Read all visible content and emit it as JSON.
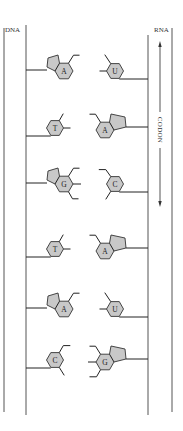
{
  "labels": {
    "dna": "DNA",
    "rna": "RNA",
    "codon": "CODON"
  },
  "colors": {
    "base_fill": "#c8c8c8",
    "line": "#333333",
    "background": "#ffffff"
  },
  "pairs": [
    {
      "dna_base": "A",
      "dna_type": "purine",
      "rna_base": "U",
      "rna_type": "pyrimidine",
      "y": 68
    },
    {
      "dna_base": "T",
      "dna_type": "pyrimidine",
      "rna_base": "A",
      "rna_type": "purine",
      "y": 128
    },
    {
      "dna_base": "G",
      "dna_type": "purine",
      "rna_base": "C",
      "rna_type": "pyrimidine",
      "y": 181
    },
    {
      "dna_base": "T",
      "dna_type": "pyrimidine",
      "rna_base": "A",
      "rna_type": "purine",
      "y": 249
    },
    {
      "dna_base": "A",
      "dna_type": "purine",
      "rna_base": "U",
      "rna_type": "pyrimidine",
      "y": 306
    },
    {
      "dna_base": "C",
      "dna_type": "pyrimidine",
      "rna_base": "G",
      "rna_type": "purine",
      "y": 360
    }
  ]
}
